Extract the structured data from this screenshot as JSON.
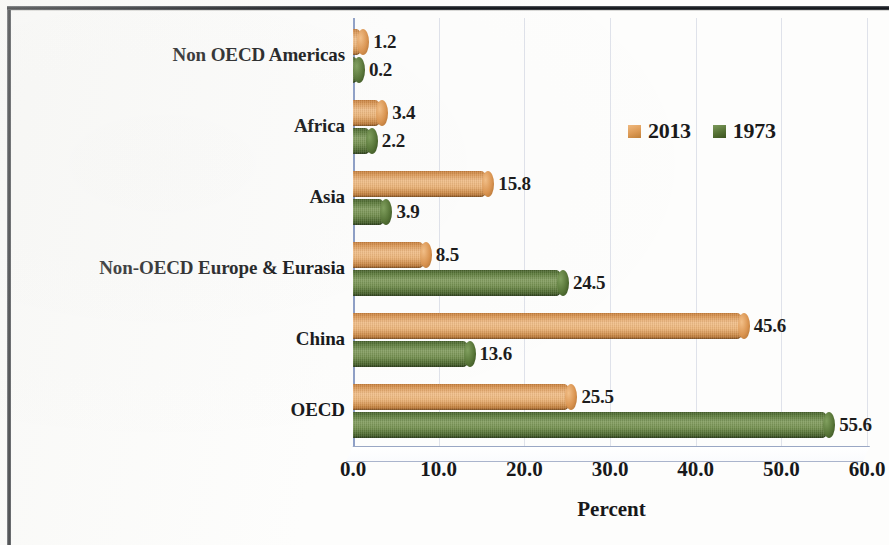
{
  "chart_data": {
    "type": "bar",
    "orientation": "horizontal",
    "title": "",
    "xlabel": "Percent",
    "ylabel": "",
    "xlim": [
      0.0,
      60.0
    ],
    "xticks": [
      "0.0",
      "10.0",
      "20.0",
      "30.0",
      "40.0",
      "50.0",
      "60.0"
    ],
    "xtick_values": [
      0,
      10,
      20,
      30,
      40,
      50,
      60
    ],
    "grid": "vertical",
    "legend_position": "upper-right-inside",
    "categories": [
      "Non OECD Americas",
      "Africa",
      "Asia",
      "Non-OECD Europe & Eurasia",
      "China",
      "OECD"
    ],
    "series": [
      {
        "name": "2013",
        "color": "#DD9A55",
        "values": [
          1.2,
          3.4,
          15.8,
          8.5,
          45.6,
          25.5
        ],
        "labels": [
          "1.2",
          "3.4",
          "15.8",
          "8.5",
          "45.6",
          "25.5"
        ]
      },
      {
        "name": "1973",
        "color": "#567235",
        "values": [
          0.2,
          2.2,
          3.9,
          24.5,
          13.6,
          55.6
        ],
        "labels": [
          "0.2",
          "2.2",
          "3.9",
          "24.5",
          "13.6",
          "55.6"
        ]
      }
    ]
  },
  "axis": {
    "x_title": "Percent"
  },
  "legend": {
    "items": [
      {
        "label": "2013",
        "swatch": "orange-square-icon"
      },
      {
        "label": "1973",
        "swatch": "green-square-icon"
      }
    ]
  }
}
